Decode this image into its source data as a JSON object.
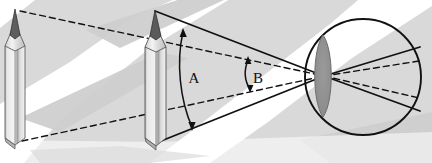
{
  "figure": {
    "title": "",
    "type": "optics-ray-diagram",
    "width": 432,
    "height": 163,
    "labels": {
      "angle_a": "A",
      "angle_b": "B"
    },
    "colors": {
      "background_gray": "#d8d8d8",
      "background_stripe": "#ffffff",
      "line": "#111111",
      "pencil_wood_light": "#efefef",
      "pencil_wood_mid": "#d2d2d2",
      "pencil_wood_dark": "#9a9a9a",
      "pencil_graphite": "#666666",
      "pencil_tip_dark": "#3a3a3a",
      "lens_fill": "#8e8e8e",
      "eye_outline": "#111111"
    },
    "objects": {
      "pencil_far": {
        "name": "pencil-far",
        "tip_x": 15,
        "tip_y": 9,
        "base_y": 141,
        "width": 20
      },
      "pencil_near": {
        "name": "pencil-near",
        "tip_x": 155,
        "tip_y": 10,
        "base_y": 141,
        "width": 20
      },
      "eye": {
        "name": "eye-circle",
        "center_x": 363,
        "center_y": 77,
        "radius": 58
      },
      "lens": {
        "name": "eye-lens",
        "center_x": 323,
        "center_y": 76,
        "half_width": 10,
        "half_height": 41
      }
    },
    "angles": {
      "a": {
        "vertex_x": 323,
        "vertex_y": 76,
        "arc_top_x": 184,
        "arc_top_y": 30,
        "arc_bottom_x": 193,
        "arc_bottom_y": 129,
        "label_x": 194,
        "label_y": 82,
        "description": "large visual angle subtended by near pencil"
      },
      "b": {
        "vertex_x": 323,
        "vertex_y": 76,
        "arc_top_x": 249,
        "arc_top_y": 58,
        "arc_bottom_x": 251,
        "arc_bottom_y": 91,
        "label_x": 257,
        "label_y": 82,
        "description": "small visual angle subtended by far pencil"
      }
    },
    "rays": {
      "solid_from_near_pencil": [
        {
          "from": [
            155,
            11
          ],
          "to": [
            324,
            76
          ]
        },
        {
          "from": [
            161,
            141
          ],
          "to": [
            324,
            76
          ]
        }
      ],
      "dashed_from_far_pencil": [
        {
          "from": [
            20,
            11
          ],
          "to": [
            324,
            76
          ]
        },
        {
          "from": [
            22,
            141
          ],
          "to": [
            324,
            76
          ]
        }
      ],
      "solid_exit": [
        {
          "from": [
            324,
            76
          ],
          "to": [
            420,
            47
          ]
        },
        {
          "from": [
            324,
            76
          ],
          "to": [
            420,
            111
          ]
        }
      ],
      "dashed_exit": [
        {
          "from": [
            324,
            76
          ],
          "to": [
            419,
            61
          ]
        },
        {
          "from": [
            324,
            76
          ],
          "to": [
            419,
            98
          ]
        }
      ]
    }
  }
}
